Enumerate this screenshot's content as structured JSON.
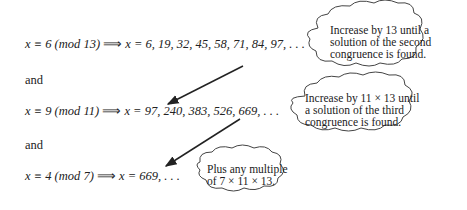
{
  "equations": [
    {
      "lhs": "x ≡ 6 (mod 13)",
      "implies": "⟹",
      "rhs": "x = 6, 19, 32, 45, 58, 71, 84, 97, . . ."
    },
    {
      "lhs": "x ≡ 9 (mod 11)",
      "implies": "⟹",
      "rhs": "x = 97, 240, 383, 526, 669, . . ."
    },
    {
      "lhs": "x ≡ 4 (mod 7)",
      "implies": "⟹",
      "rhs": "x = 669, . . ."
    }
  ],
  "connectors": [
    "and",
    "and"
  ],
  "callouts": [
    {
      "lines": [
        "Increase by 13 until a",
        "solution of the second",
        "congruence is found."
      ]
    },
    {
      "lines": [
        "Increase by 11 × 13 until",
        "a solution of the third",
        "congruence is found."
      ]
    },
    {
      "lines": [
        "Plus any multiple",
        "of 7 × 11 × 13."
      ]
    }
  ]
}
